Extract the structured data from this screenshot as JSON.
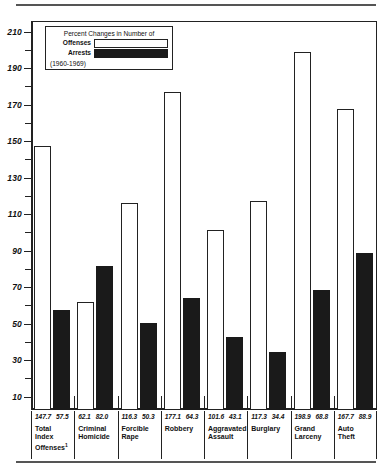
{
  "legend": {
    "title": "Percent Changes in Number of",
    "offenses_label": "Offenses",
    "arrests_label": "Arrests",
    "years": "(1960-1969)",
    "offenses_color": "#ffffff",
    "arrests_color": "#1a1a1a"
  },
  "axis": {
    "major_ticks": [
      "210",
      "190",
      "170",
      "150",
      "130",
      "110",
      "90",
      "70",
      "50",
      "30",
      "10"
    ]
  },
  "chart_data": {
    "type": "bar",
    "title": "Percent Changes in Number of",
    "subtitle": "(1960-1969)",
    "xlabel": "",
    "ylabel": "",
    "ylim": [
      0,
      220
    ],
    "grid": false,
    "legend_position": "top-left",
    "categories": [
      "Total Index Offenses¹",
      "Criminal Homicide",
      "Forcible Rape",
      "Robbery",
      "Aggravated Assault",
      "Burglary",
      "Grand Larceny",
      "Auto Theft"
    ],
    "series": [
      {
        "name": "Offenses",
        "color": "#ffffff",
        "values": [
          147.7,
          62.1,
          116.3,
          177.1,
          101.6,
          117.3,
          198.9,
          167.7
        ]
      },
      {
        "name": "Arrests",
        "color": "#1a1a1a",
        "values": [
          57.5,
          82.0,
          50.3,
          64.3,
          43.1,
          34.4,
          68.8,
          88.9
        ]
      }
    ]
  },
  "x_labels": [
    {
      "values": "147.7  57.5",
      "v1": "147.7",
      "v2": "57.5",
      "name_line1": "Total",
      "name_line2": "Index",
      "name_line3": "Offenses",
      "sup": "1"
    },
    {
      "values": "62.1  82.0",
      "v1": "62.1",
      "v2": "82.0",
      "name_line1": "Criminal",
      "name_line2": "Homicide",
      "name_line3": "",
      "sup": ""
    },
    {
      "values": "116.3  50.3",
      "v1": "116.3",
      "v2": "50.3",
      "name_line1": "Forcible",
      "name_line2": "Rape",
      "name_line3": "",
      "sup": ""
    },
    {
      "values": "177.1  64.3",
      "v1": "177.1",
      "v2": "64.3",
      "name_line1": "Robbery",
      "name_line2": "",
      "name_line3": "",
      "sup": ""
    },
    {
      "values": "101.6  43.1",
      "v1": "101.6",
      "v2": "43.1",
      "name_line1": "Aggravated",
      "name_line2": "Assault",
      "name_line3": "",
      "sup": ""
    },
    {
      "values": "117.3  34.4",
      "v1": "117.3",
      "v2": "34.4",
      "name_line1": "Burglary",
      "name_line2": "",
      "name_line3": "",
      "sup": ""
    },
    {
      "values": "198.9  68.8",
      "v1": "198.9",
      "v2": "68.8",
      "name_line1": "Grand",
      "name_line2": "Larceny",
      "name_line3": "",
      "sup": ""
    },
    {
      "values": "167.7  88.9",
      "v1": "167.7",
      "v2": "88.9",
      "name_line1": "Auto",
      "name_line2": "Theft",
      "name_line3": "",
      "sup": ""
    }
  ]
}
